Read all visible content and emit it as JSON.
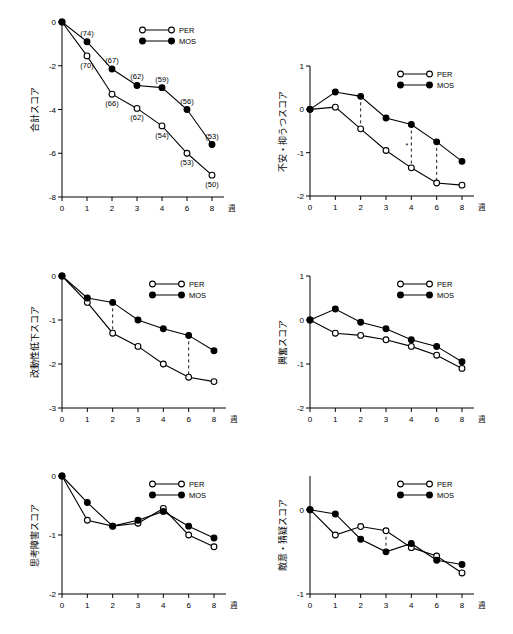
{
  "chart_data": [
    {
      "id": "total",
      "type": "line",
      "title": "",
      "ylabel": "合計スコア",
      "xlabel": "週",
      "x": [
        0,
        1,
        2,
        3,
        4,
        6,
        8
      ],
      "xticklabels": [
        "0",
        "1",
        "2",
        "3",
        "4",
        "6",
        "8"
      ],
      "ylim": [
        -8,
        0
      ],
      "yticks": [
        0,
        -2,
        -4,
        -6,
        -8
      ],
      "yticklabels": [
        "0",
        "-2",
        "-4",
        "-6",
        "-8"
      ],
      "grid": false,
      "legend_position": "top-right",
      "series": [
        {
          "name": "PER",
          "marker": "open",
          "values": [
            0,
            -1.55,
            -3.3,
            -3.95,
            -4.75,
            -6.0,
            -7.0
          ]
        },
        {
          "name": "MOS",
          "marker": "closed",
          "values": [
            0,
            -0.9,
            -2.15,
            -2.9,
            -3.0,
            -4.0,
            -5.6
          ]
        }
      ],
      "point_labels": [
        {
          "text": "(74)",
          "x": 1,
          "series": "MOS",
          "pos": "above"
        },
        {
          "text": "(70)",
          "x": 1,
          "series": "PER",
          "pos": "below"
        },
        {
          "text": "(67)",
          "x": 2,
          "series": "MOS",
          "pos": "above"
        },
        {
          "text": "(66)",
          "x": 2,
          "series": "PER",
          "pos": "below"
        },
        {
          "text": "(62)",
          "x": 3,
          "series": "MOS",
          "pos": "above"
        },
        {
          "text": "(62)",
          "x": 3,
          "series": "PER",
          "pos": "below"
        },
        {
          "text": "(59)",
          "x": 4,
          "series": "MOS",
          "pos": "above"
        },
        {
          "text": "(54)",
          "x": 4,
          "series": "PER",
          "pos": "below"
        },
        {
          "text": "(56)",
          "x": 6,
          "series": "MOS",
          "pos": "above"
        },
        {
          "text": "(53)",
          "x": 6,
          "series": "PER",
          "pos": "below"
        },
        {
          "text": "(53)",
          "x": 8,
          "series": "MOS",
          "pos": "above"
        },
        {
          "text": "(50)",
          "x": 8,
          "series": "PER",
          "pos": "below"
        }
      ]
    },
    {
      "id": "anxiety",
      "type": "line",
      "title": "",
      "ylabel": "不安・抑うつスコア",
      "xlabel": "週",
      "x": [
        0,
        1,
        2,
        3,
        4,
        6,
        8
      ],
      "xticklabels": [
        "0",
        "1",
        "2",
        "3",
        "4",
        "6",
        "8"
      ],
      "ylim": [
        -2,
        1
      ],
      "yticks": [
        1,
        0,
        -1,
        -2
      ],
      "yticklabels": [
        "1",
        "0",
        "-1",
        "-2"
      ],
      "grid": false,
      "legend_position": "top-right",
      "series": [
        {
          "name": "PER",
          "marker": "open",
          "values": [
            0,
            0.05,
            -0.45,
            -0.95,
            -1.35,
            -1.7,
            -1.75
          ]
        },
        {
          "name": "MOS",
          "marker": "closed",
          "values": [
            0,
            0.4,
            0.3,
            -0.2,
            -0.35,
            -0.75,
            -1.2
          ]
        }
      ],
      "annotations": [
        {
          "type": "dashed-bracket",
          "x": 2,
          "star": ""
        },
        {
          "type": "dashed-bracket",
          "x": 4,
          "star": "*"
        },
        {
          "type": "dashed-bracket",
          "x": 6,
          "star": ""
        }
      ]
    },
    {
      "id": "retardation",
      "type": "line",
      "title": "",
      "ylabel": "改動性低下スコア",
      "xlabel": "週",
      "x": [
        0,
        1,
        2,
        3,
        4,
        6,
        8
      ],
      "xticklabels": [
        "0",
        "1",
        "2",
        "3",
        "4",
        "6",
        "8"
      ],
      "ylim": [
        -3,
        0
      ],
      "yticks": [
        0,
        -1,
        -2,
        -3
      ],
      "yticklabels": [
        "0",
        "-1",
        "-2",
        "-3"
      ],
      "grid": false,
      "legend_position": "top-right",
      "series": [
        {
          "name": "PER",
          "marker": "open",
          "values": [
            0,
            -0.6,
            -1.3,
            -1.6,
            -2.0,
            -2.3,
            -2.4
          ]
        },
        {
          "name": "MOS",
          "marker": "closed",
          "values": [
            0,
            -0.5,
            -0.6,
            -1.0,
            -1.2,
            -1.35,
            -1.7
          ]
        }
      ],
      "annotations": [
        {
          "type": "dashed-bracket",
          "x": 2,
          "star": ""
        },
        {
          "type": "dashed-bracket",
          "x": 6,
          "star": ""
        }
      ]
    },
    {
      "id": "insomnia",
      "type": "line",
      "title": "",
      "ylabel": "興奮スコア",
      "xlabel": "週",
      "x": [
        0,
        1,
        2,
        3,
        4,
        6,
        8
      ],
      "xticklabels": [
        "0",
        "1",
        "2",
        "3",
        "4",
        "6",
        "8"
      ],
      "ylim": [
        -2,
        1
      ],
      "yticks": [
        1,
        0,
        -1,
        -2
      ],
      "yticklabels": [
        "1",
        "0",
        "-1",
        "-2"
      ],
      "grid": false,
      "legend_position": "top-right",
      "series": [
        {
          "name": "PER",
          "marker": "open",
          "values": [
            0,
            -0.3,
            -0.35,
            -0.45,
            -0.6,
            -0.8,
            -1.1
          ]
        },
        {
          "name": "MOS",
          "marker": "closed",
          "values": [
            0,
            0.25,
            -0.05,
            -0.2,
            -0.45,
            -0.6,
            -0.95
          ]
        }
      ]
    },
    {
      "id": "cognitive",
      "type": "line",
      "title": "",
      "ylabel": "思考障害スコア",
      "xlabel": "週",
      "x": [
        0,
        1,
        2,
        3,
        4,
        6,
        8
      ],
      "xticklabels": [
        "0",
        "1",
        "2",
        "3",
        "4",
        "6",
        "8"
      ],
      "ylim": [
        -2,
        0
      ],
      "yticks": [
        0,
        -1,
        -2
      ],
      "yticklabels": [
        "0",
        "-1",
        "-2"
      ],
      "grid": false,
      "legend_position": "top-right",
      "series": [
        {
          "name": "PER",
          "marker": "open",
          "values": [
            0,
            -0.75,
            -0.85,
            -0.8,
            -0.55,
            -1.0,
            -1.2
          ]
        },
        {
          "name": "MOS",
          "marker": "closed",
          "values": [
            0,
            -0.45,
            -0.85,
            -0.75,
            -0.6,
            -0.85,
            -1.05
          ]
        }
      ]
    },
    {
      "id": "diurnal",
      "type": "line",
      "title": "",
      "ylabel": "敵意・猜疑スコア",
      "xlabel": "週",
      "x": [
        0,
        1,
        2,
        3,
        4,
        6,
        8
      ],
      "xticklabels": [
        "0",
        "1",
        "2",
        "3",
        "4",
        "6",
        "8"
      ],
      "ylim": [
        -1,
        0.4
      ],
      "yticks": [
        0,
        -1
      ],
      "yticklabels": [
        "0",
        "-1"
      ],
      "grid": false,
      "legend_position": "top-right",
      "series": [
        {
          "name": "PER",
          "marker": "open",
          "values": [
            0,
            -0.3,
            -0.2,
            -0.25,
            -0.45,
            -0.55,
            -0.75
          ]
        },
        {
          "name": "MOS",
          "marker": "closed",
          "values": [
            0,
            -0.05,
            -0.35,
            -0.5,
            -0.4,
            -0.6,
            -0.65
          ]
        }
      ],
      "annotations": [
        {
          "type": "dashed-bracket",
          "x": 3,
          "star": ""
        }
      ]
    }
  ],
  "legend": {
    "per": "PER",
    "mos": "MOS"
  },
  "axis": {
    "x_unit": "週"
  }
}
